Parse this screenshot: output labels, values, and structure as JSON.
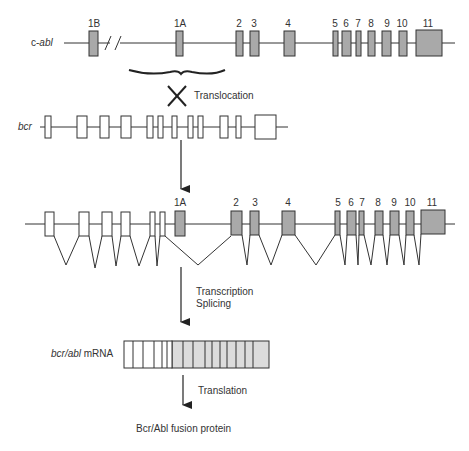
{
  "diagram": {
    "title": "",
    "c_abl": {
      "label_prefix": "c-",
      "label_italic": "abl",
      "exons": [
        {
          "id": "1B",
          "label": "1B"
        },
        {
          "id": "1A",
          "label": "1A"
        },
        {
          "id": "2",
          "label": "2"
        },
        {
          "id": "3",
          "label": "3"
        },
        {
          "id": "4",
          "label": "4"
        },
        {
          "id": "5",
          "label": "5"
        },
        {
          "id": "6",
          "label": "6"
        },
        {
          "id": "7",
          "label": "7"
        },
        {
          "id": "8",
          "label": "8"
        },
        {
          "id": "9",
          "label": "9"
        },
        {
          "id": "10",
          "label": "10"
        },
        {
          "id": "11",
          "label": "11"
        }
      ],
      "break_symbol": "//"
    },
    "translocation": {
      "label": "Translocation",
      "symbol": "X"
    },
    "bcr": {
      "label": "bcr",
      "exon_count": 13
    },
    "fusion_gene": {
      "labels": [
        "1A",
        "2",
        "3",
        "4",
        "5",
        "6",
        "7",
        "8",
        "9",
        "10",
        "11"
      ]
    },
    "steps": {
      "transcription": "Transcription",
      "splicing": "Splicing",
      "translation": "Translation"
    },
    "mrna": {
      "label_italic": "bcr/abl",
      "label_suffix": " mRNA",
      "bcr_segments": 6,
      "abl_segments": 11
    },
    "protein": {
      "label": "Bcr/Abl fusion protein"
    },
    "colors": {
      "abl_exon": "#a9a9a9",
      "bcr_exon": "#ffffff",
      "line": "#333333",
      "mrna_abl": "#dcdcdc"
    }
  }
}
